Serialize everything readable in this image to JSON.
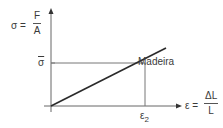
{
  "diagram": {
    "y_axis": {
      "symbol": "σ =",
      "numerator": "F",
      "denominator": "A"
    },
    "x_axis": {
      "symbol": "ε =",
      "numerator": "ΔL",
      "denominator": "L"
    },
    "y_marker": "σ",
    "x_marker": "ε",
    "x_marker_sub": "2",
    "curve_label": "Madeira",
    "colors": {
      "axis": "#666666",
      "line": "#2a2a2a",
      "guide": "#777777",
      "text": "#3a3a3a"
    }
  }
}
